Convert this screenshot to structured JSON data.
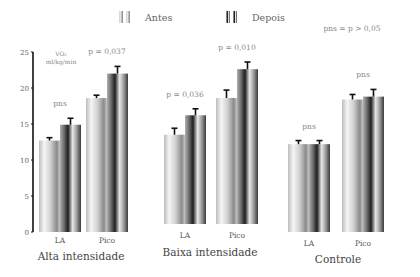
{
  "chart_data": {
    "type": "bar",
    "title": "",
    "ylabel": "VO2 ml/kg/min",
    "ylabel_lines": [
      "VO₂",
      "ml/kg/min"
    ],
    "xlabel": "",
    "ylim": [
      0,
      25
    ],
    "yticks": [
      0,
      5,
      10,
      15,
      20,
      25
    ],
    "grid": false,
    "legend_position": "top-center",
    "series": [
      {
        "name": "Antes",
        "color_light": "#f2f2f2",
        "color_dark": "#9a9a9a"
      },
      {
        "name": "Depois",
        "color_light": "#e6e6e6",
        "color_dark": "#2a2a2a"
      }
    ],
    "groups": [
      {
        "name": "Alta intensidade",
        "categories": [
          {
            "label": "LA",
            "values": [
              12.7,
              14.9
            ],
            "errors": [
              0.4,
              0.9
            ],
            "annotation": "pns"
          },
          {
            "label": "Pico",
            "values": [
              18.6,
              22.0
            ],
            "errors": [
              0.4,
              1.0
            ],
            "annotation": "p = 0,037"
          }
        ]
      },
      {
        "name": "Baixa intensidade",
        "categories": [
          {
            "label": "LA",
            "values": [
              12.4,
              15.1
            ],
            "errors": [
              0.9,
              0.9
            ],
            "annotation": "p = 0,036"
          },
          {
            "label": "Pico",
            "values": [
              17.5,
              21.5
            ],
            "errors": [
              1.1,
              1.0
            ],
            "annotation": "p = 0,010"
          }
        ]
      },
      {
        "name": "Controle",
        "categories": [
          {
            "label": "LA",
            "values": [
              12.2,
              12.2
            ],
            "errors": [
              0.5,
              0.5
            ],
            "annotation": "pns"
          },
          {
            "label": "Pico",
            "values": [
              18.4,
              18.8
            ],
            "errors": [
              0.7,
              1.0
            ],
            "annotation": "pns"
          }
        ]
      }
    ],
    "annotations": [
      "pns = p > 0,05"
    ]
  },
  "legend": {
    "antes": "Antes",
    "depois": "Depois"
  },
  "footnote": "pns = p > 0,05",
  "axis_unit": {
    "line1": "VO₂",
    "line2": "ml/kg/min"
  }
}
